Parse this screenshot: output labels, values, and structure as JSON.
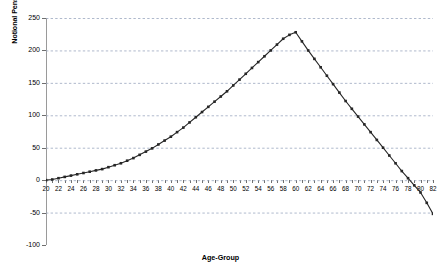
{
  "top_caption": {
    "text": "",
    "note": "clipped text fragment at image top edge, illegible"
  },
  "axis_titles": {
    "y": "Notional Pension Wealth ('1000 Euro)",
    "x": "Age-Group"
  },
  "colors": {
    "series": "#262626",
    "gridline": "#9aa7bf",
    "axis": "#8c8c8c",
    "text": "#000000",
    "background": "#ffffff"
  },
  "chart_data": {
    "type": "line",
    "title": "",
    "xlabel": "Age-Group",
    "ylabel": "Notional Pension Wealth ('1000 Euro)",
    "xlim": [
      20,
      82
    ],
    "ylim": [
      -100,
      250
    ],
    "ytick_labels": [
      "250",
      "200",
      "150",
      "100",
      "50",
      "0",
      "-50",
      "-100"
    ],
    "yticks": [
      250,
      200,
      150,
      100,
      50,
      0,
      -50,
      -100
    ],
    "xtick_labels": [
      "20",
      "22",
      "24",
      "26",
      "28",
      "30",
      "32",
      "34",
      "36",
      "38",
      "40",
      "42",
      "44",
      "46",
      "48",
      "50",
      "52",
      "54",
      "56",
      "58",
      "60",
      "62",
      "64",
      "66",
      "68",
      "70",
      "72",
      "74",
      "76",
      "78",
      "80",
      "82"
    ],
    "xticks": [
      20,
      22,
      24,
      26,
      28,
      30,
      32,
      34,
      36,
      38,
      40,
      42,
      44,
      46,
      48,
      50,
      52,
      54,
      56,
      58,
      60,
      62,
      64,
      66,
      68,
      70,
      72,
      74,
      76,
      78,
      80,
      82
    ],
    "grid": true,
    "grid_axis": "y",
    "grid_style": "dashed",
    "legend": false,
    "marker": "square",
    "x": [
      20,
      21,
      22,
      23,
      24,
      25,
      26,
      27,
      28,
      29,
      30,
      31,
      32,
      33,
      34,
      35,
      36,
      37,
      38,
      39,
      40,
      41,
      42,
      43,
      44,
      45,
      46,
      47,
      48,
      49,
      50,
      51,
      52,
      53,
      54,
      55,
      56,
      57,
      58,
      59,
      60,
      61,
      62,
      63,
      64,
      65,
      66,
      67,
      68,
      69,
      70,
      71,
      72,
      73,
      74,
      75,
      76,
      77,
      78,
      79,
      80,
      81,
      82
    ],
    "values": [
      0,
      1,
      3,
      5,
      7,
      9,
      11,
      13,
      15,
      17,
      20,
      23,
      26,
      30,
      34,
      39,
      44,
      49,
      55,
      61,
      67,
      74,
      81,
      89,
      97,
      105,
      113,
      121,
      129,
      137,
      146,
      155,
      164,
      173,
      182,
      191,
      200,
      209,
      218,
      224,
      228,
      214,
      200,
      187,
      174,
      161,
      148,
      135,
      122,
      110,
      98,
      86,
      74,
      62,
      50,
      38,
      26,
      14,
      3,
      -8,
      -19,
      -35,
      -52
    ],
    "series": [
      {
        "name": "Notional Pension Wealth",
        "values": [
          0,
          1,
          3,
          5,
          7,
          9,
          11,
          13,
          15,
          17,
          20,
          23,
          26,
          30,
          34,
          39,
          44,
          49,
          55,
          61,
          67,
          74,
          81,
          89,
          97,
          105,
          113,
          121,
          129,
          137,
          146,
          155,
          164,
          173,
          182,
          191,
          200,
          209,
          218,
          224,
          228,
          214,
          200,
          187,
          174,
          161,
          148,
          135,
          122,
          110,
          98,
          86,
          74,
          62,
          50,
          38,
          26,
          14,
          3,
          -8,
          -19,
          -35,
          -52
        ]
      }
    ],
    "annotations": {
      "peak_age": 60,
      "peak_value": 228,
      "zero_crossing_age": 78
    }
  }
}
